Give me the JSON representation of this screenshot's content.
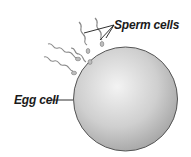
{
  "diagram": {
    "labels": {
      "sperm": "Sperm cells",
      "egg": "Egg cell"
    },
    "colors": {
      "egg_fill_light": "#f2f2f2",
      "egg_fill_dark": "#a9a9a9",
      "egg_outline": "#555555",
      "sperm": "#8a8a8a",
      "leader": "#1a1a1a"
    }
  }
}
